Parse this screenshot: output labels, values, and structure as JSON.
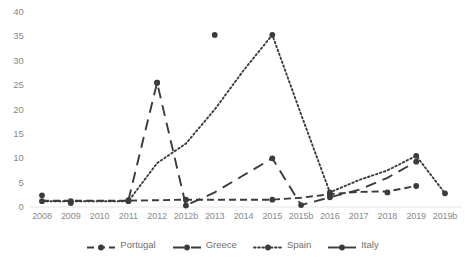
{
  "chart_data": {
    "type": "line",
    "title": "",
    "subtitle": "",
    "xlabel": "",
    "ylabel": "",
    "categories": [
      "2008",
      "2009",
      "2010",
      "2011",
      "2012",
      "2012b",
      "2013",
      "2014",
      "2015",
      "2015b",
      "2016",
      "2017",
      "2018",
      "2019",
      "2019b"
    ],
    "ylim": [
      0,
      40
    ],
    "yticks": [
      0,
      5,
      10,
      15,
      20,
      25,
      30,
      35,
      40
    ],
    "ytick_labels": [
      "0",
      "5",
      "10",
      "15",
      "20",
      "25",
      "30",
      "35",
      "40"
    ],
    "grid": false,
    "legend_position": "bottom",
    "series": [
      {
        "name": "Portugal",
        "style": "dashed",
        "color": "#3b3b3b",
        "values": [
          1.3,
          1.3,
          1.3,
          1.3,
          1.4,
          1.5,
          1.5,
          1.5,
          1.5,
          1.9,
          2.6,
          3.1,
          3.2,
          4.3,
          null
        ],
        "markers": [
          "2012b",
          "2015",
          "2016",
          "2019"
        ]
      },
      {
        "name": "Greece",
        "style": "long-dash",
        "color": "#3b3b3b",
        "values": [
          null,
          0.8,
          null,
          1.4,
          25.5,
          0.3,
          3.0,
          6.5,
          10.0,
          0.4,
          2.0,
          3.5,
          6.0,
          9.3,
          null
        ],
        "markers": [
          "2009",
          "2011",
          "2012",
          "2012b",
          "2015",
          "2015b",
          "2016",
          "2019"
        ]
      },
      {
        "name": "Spain",
        "style": "dotted",
        "color": "#3b3b3b",
        "values": [
          1.2,
          1.2,
          1.2,
          1.2,
          9.0,
          13.0,
          20.0,
          28.0,
          35.3,
          19.0,
          3.0,
          5.5,
          7.5,
          10.5,
          2.8
        ],
        "markers": [
          "2008",
          "2009",
          "2011",
          "2015",
          "2016",
          "2019",
          "2019b"
        ]
      },
      {
        "name": "Italy",
        "style": "solid",
        "color": "#3b3b3b",
        "values": [
          2.4,
          null,
          null,
          null,
          25.5,
          null,
          35.3,
          null,
          null,
          null,
          null,
          null,
          3.0,
          null,
          null
        ],
        "markers": [
          "2008",
          "2012",
          "2013",
          "2018"
        ]
      }
    ]
  },
  "legend": {
    "items": [
      {
        "label": "Portugal",
        "key_name": "legend-key-portugal"
      },
      {
        "label": "Greece",
        "key_name": "legend-key-greece"
      },
      {
        "label": "Spain",
        "key_name": "legend-key-spain"
      },
      {
        "label": "Italy",
        "key_name": "legend-key-italy"
      }
    ]
  }
}
